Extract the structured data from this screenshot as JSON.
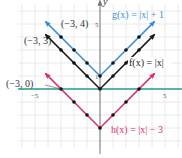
{
  "chart_data": {
    "type": "line",
    "title": "",
    "xlabel": "",
    "ylabel": "y",
    "xlim": [
      -6,
      6
    ],
    "ylim": [
      -4,
      7
    ],
    "grid": true,
    "x_ticks": [
      {
        "value": -5,
        "label": "−5"
      },
      {
        "value": 5,
        "label": "5"
      }
    ],
    "y_ticks": [
      {
        "value": 5,
        "label": "5"
      },
      {
        "value": 1,
        "label": "1"
      }
    ],
    "series": [
      {
        "name": "g(x) = |x| + 1",
        "label": "g(x) = |x| + 1",
        "color": "#3b8fd6",
        "x": [
          -3,
          -2,
          -1,
          0,
          1,
          2,
          3
        ],
        "y": [
          4,
          3,
          2,
          1,
          2,
          3,
          4
        ]
      },
      {
        "name": "f(x) = |x|",
        "label": "f(x) = |x|",
        "color": "#1a1a1a",
        "x": [
          -3,
          -2,
          -1,
          0,
          1,
          2,
          3
        ],
        "y": [
          3,
          2,
          1,
          0,
          1,
          2,
          3
        ]
      },
      {
        "name": "h(x) = |x| − 3",
        "label": "h(x) = |x| − 3",
        "color": "#d9326a",
        "x": [
          -3,
          -2,
          -1,
          0,
          1,
          2,
          3
        ],
        "y": [
          0,
          -1,
          -2,
          -3,
          -2,
          -1,
          0
        ]
      }
    ],
    "annotations": [
      {
        "text": "(−3, 4)",
        "x": -3,
        "y": 4
      },
      {
        "text": "(−3, 3)",
        "x": -3,
        "y": 3
      },
      {
        "text": "(−3, 0)",
        "x": -3,
        "y": 0
      }
    ],
    "x_axis_color": "#2a9a8a"
  }
}
